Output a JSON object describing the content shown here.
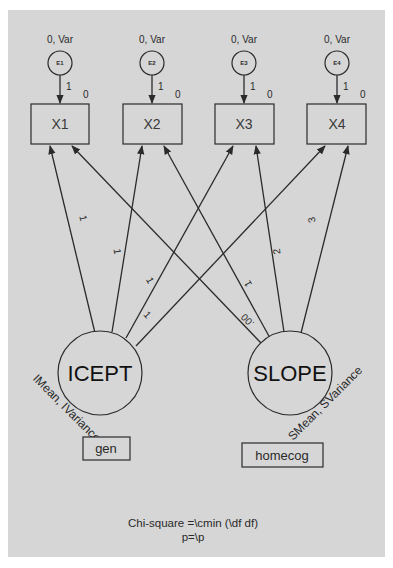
{
  "diagram": {
    "type": "structural-equation-model",
    "error_nodes": [
      {
        "id": "E1",
        "label": "E1",
        "param": "0, Var",
        "path_label": "1",
        "intercept": "0"
      },
      {
        "id": "E2",
        "label": "E2",
        "param": "0, Var",
        "path_label": "1",
        "intercept": "0"
      },
      {
        "id": "E3",
        "label": "E3",
        "param": "0, Var",
        "path_label": "1",
        "intercept": "0"
      },
      {
        "id": "E4",
        "label": "E4",
        "param": "0, Var",
        "path_label": "1",
        "intercept": "0"
      }
    ],
    "observed_nodes": [
      {
        "id": "X1",
        "label": "X1"
      },
      {
        "id": "X2",
        "label": "X2"
      },
      {
        "id": "X3",
        "label": "X3"
      },
      {
        "id": "X4",
        "label": "X4"
      }
    ],
    "latent_nodes": [
      {
        "id": "ICEPT",
        "label": "ICEPT",
        "param": "IMean, IVariance"
      },
      {
        "id": "SLOPE",
        "label": "SLOPE",
        "param": "SMean, SVariance"
      }
    ],
    "group_boxes": [
      {
        "id": "gen",
        "label": "gen"
      },
      {
        "id": "homecog",
        "label": "homecog"
      }
    ],
    "paths": [
      {
        "from": "ICEPT",
        "to": "X1",
        "label": "1"
      },
      {
        "from": "ICEPT",
        "to": "X2",
        "label": "1"
      },
      {
        "from": "ICEPT",
        "to": "X3",
        "label": "1"
      },
      {
        "from": "ICEPT",
        "to": "X4",
        "label": "1"
      },
      {
        "from": "SLOPE",
        "to": "X1",
        "label": ".00"
      },
      {
        "from": "SLOPE",
        "to": "X2",
        "label": "1"
      },
      {
        "from": "SLOPE",
        "to": "X3",
        "label": "2"
      },
      {
        "from": "SLOPE",
        "to": "X4",
        "label": "3"
      }
    ],
    "footer": {
      "line1": "Chi-square =\\cmin (\\df df)",
      "line2": "p=\\p"
    },
    "colors": {
      "panel": "#d6d6d6",
      "stroke": "#2a2a2a",
      "background": "#ffffff"
    }
  }
}
